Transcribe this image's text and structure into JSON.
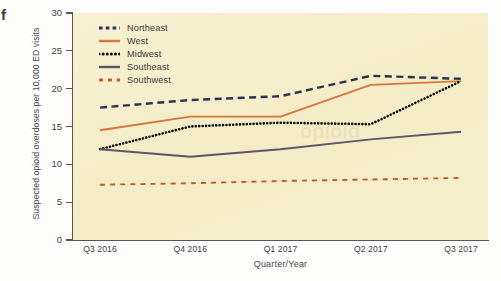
{
  "figure": {
    "panel_letter": "f"
  },
  "chart_data": {
    "type": "line",
    "title": "",
    "xlabel": "Quarter/Year",
    "ylabel": "Suspected opioid overdoses per 10,000 ED visits",
    "categories": [
      "Q3 2016",
      "Q4 2016",
      "Q1 2017",
      "Q2 2017",
      "Q3 2017"
    ],
    "ylim": [
      0,
      30
    ],
    "yticks": [
      0,
      5,
      10,
      15,
      20,
      25,
      30
    ],
    "grid": false,
    "legend_position": "top-left inside plot",
    "plot_background": "#f6efcd",
    "series": [
      {
        "name": "Northeast",
        "values": [
          17.5,
          18.5,
          19.0,
          21.7,
          21.3
        ],
        "color": "#2b3253",
        "style": "dashed"
      },
      {
        "name": "West",
        "values": [
          14.5,
          16.3,
          16.3,
          20.5,
          21.0
        ],
        "color": "#d8743c",
        "style": "solid"
      },
      {
        "name": "Midwest",
        "values": [
          12.0,
          15.0,
          15.5,
          15.3,
          21.0
        ],
        "color": "#111111",
        "style": "dotted"
      },
      {
        "name": "Southeast",
        "values": [
          12.0,
          11.0,
          12.0,
          13.3,
          14.3
        ],
        "color": "#5d5466",
        "style": "solid"
      },
      {
        "name": "Southwest",
        "values": [
          7.3,
          7.5,
          7.8,
          8.0,
          8.2
        ],
        "color": "#bf5a2b",
        "style": "dash-dot"
      }
    ]
  }
}
